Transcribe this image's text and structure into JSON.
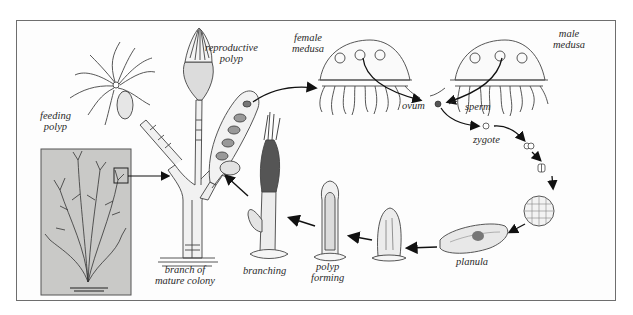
{
  "diagram": {
    "colors": {
      "frame": "#6e6e6e",
      "colony_panel": "#c9c9c7",
      "ink": "#2a2a2a",
      "arrow": "#111111"
    },
    "labels": {
      "feeding_polyp": [
        "feeding",
        "polyp"
      ],
      "reproductive_polyp": [
        "reproductive",
        "polyp"
      ],
      "female_medusa": [
        "female",
        "medusa"
      ],
      "male_medusa": [
        "male",
        "medusa"
      ],
      "ovum": "ovum",
      "sperm": "sperm",
      "zygote": "zygote",
      "planula": "planula",
      "polyp_forming": [
        "polyp",
        "forming"
      ],
      "branching": "branching",
      "branch_of_mature_colony": [
        "branch of",
        "mature colony"
      ]
    },
    "stages": [
      "feeding polyp",
      "reproductive polyp",
      "female medusa",
      "male medusa",
      "ovum",
      "sperm",
      "zygote",
      "cleavage",
      "blastula",
      "planula",
      "settled larva",
      "polyp forming",
      "branching",
      "branch of mature colony"
    ]
  }
}
